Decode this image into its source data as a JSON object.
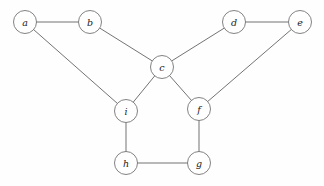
{
  "figure": {
    "background_color": "#fefefe",
    "edge_color": "#5a5a5a",
    "node_fill_color": "#ffffff",
    "node_stroke_color": "#6b6b6b",
    "label_color": "#1a1a1a",
    "node_radius": 11.5
  },
  "chart_data": {
    "type": "diagram",
    "graph_type": "undirected",
    "title": "",
    "xlabel": "",
    "ylabel": "",
    "nodes": [
      {
        "id": "a",
        "label": "a",
        "x": 25,
        "y": 22
      },
      {
        "id": "b",
        "label": "b",
        "x": 90,
        "y": 22
      },
      {
        "id": "c",
        "label": "c",
        "x": 162,
        "y": 67
      },
      {
        "id": "d",
        "label": "d",
        "x": 234,
        "y": 22
      },
      {
        "id": "e",
        "label": "e",
        "x": 300,
        "y": 22
      },
      {
        "id": "f",
        "label": "f",
        "x": 199,
        "y": 109
      },
      {
        "id": "g",
        "label": "g",
        "x": 199,
        "y": 163
      },
      {
        "id": "h",
        "label": "h",
        "x": 126,
        "y": 163
      },
      {
        "id": "i",
        "label": "i",
        "x": 126,
        "y": 111
      }
    ],
    "edges": [
      {
        "source": "a",
        "target": "b"
      },
      {
        "source": "a",
        "target": "i"
      },
      {
        "source": "b",
        "target": "c"
      },
      {
        "source": "c",
        "target": "d"
      },
      {
        "source": "c",
        "target": "i"
      },
      {
        "source": "c",
        "target": "f"
      },
      {
        "source": "d",
        "target": "e"
      },
      {
        "source": "e",
        "target": "f"
      },
      {
        "source": "f",
        "target": "g"
      },
      {
        "source": "g",
        "target": "h"
      },
      {
        "source": "h",
        "target": "i"
      }
    ],
    "node_count": 9,
    "edge_count": 11
  }
}
